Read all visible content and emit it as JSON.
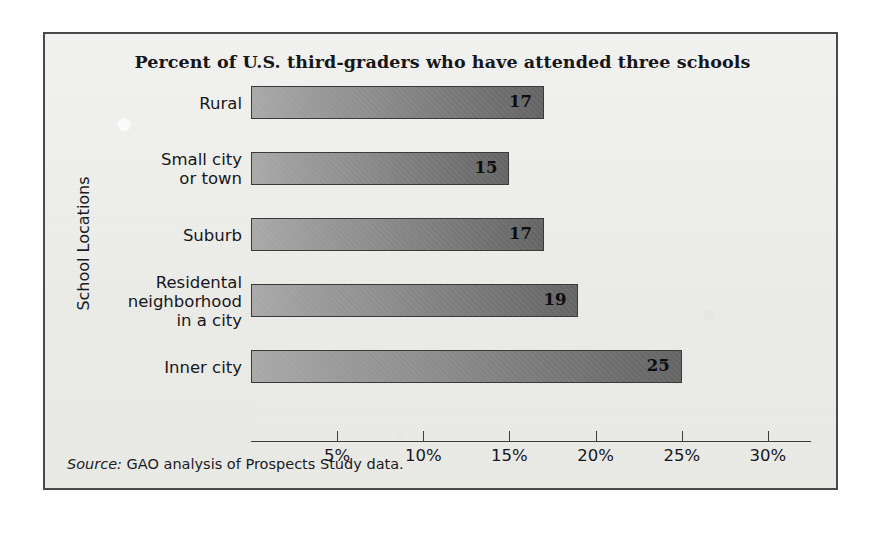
{
  "figure": {
    "source_label": "Source:",
    "source_text": " GAO analysis of Prospects Study data."
  },
  "chart_data": {
    "type": "bar",
    "orientation": "horizontal",
    "title": "Percent of U.S. third-graders who have attended three schools",
    "xlabel": "",
    "ylabel": "School Locations",
    "categories": [
      "Rural",
      "Small city\nor town",
      "Suburb",
      "Residental\nneighborhood\nin a city",
      "Inner city"
    ],
    "values": [
      17,
      15,
      17,
      19,
      25
    ],
    "value_labels": [
      "17",
      "15",
      "17",
      "19",
      "25"
    ],
    "xlim": [
      0,
      32.5
    ],
    "xticks": [
      5,
      10,
      15,
      20,
      25,
      30
    ],
    "xtick_labels": [
      "5%",
      "10%",
      "15%",
      "20%",
      "25%",
      "30%"
    ],
    "grid": false,
    "legend": null,
    "bar_gradient_from": "#a8a8a8",
    "bar_gradient_to": "#636363",
    "bar_border_color": "#3a3a3a",
    "axis_color": "#3d3d3d",
    "text_color": "#17171b",
    "panel_background": "#eeeeec",
    "frame_border_color": "#4a4a4a"
  }
}
